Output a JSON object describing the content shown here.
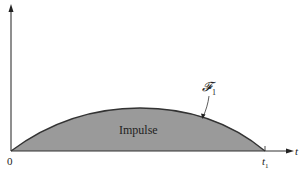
{
  "figure": {
    "region_label": "Impulse",
    "curve_label": "𝓕",
    "curve_label_sub": "1",
    "origin_label": "0",
    "end_label": "t",
    "end_label_sub": "1",
    "x_axis_label": "t"
  },
  "colors": {
    "fill": "#9a9a9a",
    "stroke": "#333333",
    "axis": "#333333"
  }
}
